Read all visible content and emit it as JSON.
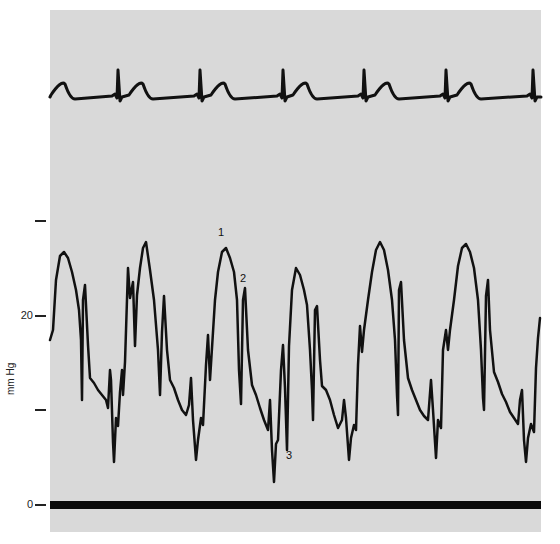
{
  "chart_data": {
    "type": "line",
    "title": "",
    "xlabel": "",
    "ylabel": "mm Hg",
    "ylim": [
      0,
      30
    ],
    "grid": false,
    "legend": null,
    "y_ticks": [
      {
        "value": 0,
        "label": "0",
        "y_px": 505
      },
      {
        "value": 10,
        "label": "",
        "y_px": 410
      },
      {
        "value": 20,
        "label": "20",
        "y_px": 316
      },
      {
        "value": 30,
        "label": "",
        "y_px": 221
      }
    ],
    "annotations": [
      {
        "label": "1",
        "x_px": 218,
        "y_px": 233
      },
      {
        "label": "2",
        "x_px": 240,
        "y_px": 279
      },
      {
        "label": "3",
        "x_px": 286,
        "y_px": 456
      }
    ],
    "series": [
      {
        "name": "ECG",
        "color": "#111111",
        "stroke_width": 3,
        "r_peaks_x": [
          118,
          200,
          283,
          364,
          446,
          533
        ],
        "t_waves_x": [
          65,
          143,
          225,
          307,
          389,
          471
        ],
        "baseline_y": 97,
        "r_peak_y": 70,
        "t_peak_y": 84
      },
      {
        "name": "Pressure",
        "units": "mm Hg",
        "color": "#111111",
        "stroke_width": 2.5,
        "points_px": [
          [
            50,
            340
          ],
          [
            53,
            330
          ],
          [
            56,
            280
          ],
          [
            60,
            256
          ],
          [
            64,
            252
          ],
          [
            68,
            258
          ],
          [
            72,
            272
          ],
          [
            76,
            290
          ],
          [
            79,
            310
          ],
          [
            81,
            340
          ],
          [
            82,
            400
          ],
          [
            83,
            300
          ],
          [
            85,
            285
          ],
          [
            88,
            345
          ],
          [
            90,
            378
          ],
          [
            94,
            383
          ],
          [
            98,
            390
          ],
          [
            102,
            395
          ],
          [
            106,
            400
          ],
          [
            108,
            408
          ],
          [
            110,
            370
          ],
          [
            111,
            380
          ],
          [
            113,
            442
          ],
          [
            114,
            462
          ],
          [
            116,
            418
          ],
          [
            118,
            426
          ],
          [
            120,
            392
          ],
          [
            122,
            370
          ],
          [
            123,
            395
          ],
          [
            125,
            362
          ],
          [
            128,
            268
          ],
          [
            130,
            298
          ],
          [
            133,
            282
          ],
          [
            135,
            346
          ],
          [
            137,
            295
          ],
          [
            140,
            268
          ],
          [
            143,
            248
          ],
          [
            146,
            242
          ],
          [
            150,
            270
          ],
          [
            154,
            300
          ],
          [
            158,
            350
          ],
          [
            160,
            395
          ],
          [
            162,
            332
          ],
          [
            164,
            296
          ],
          [
            167,
            350
          ],
          [
            170,
            380
          ],
          [
            174,
            388
          ],
          [
            178,
            400
          ],
          [
            182,
            410
          ],
          [
            186,
            415
          ],
          [
            189,
            405
          ],
          [
            191,
            378
          ],
          [
            193,
            420
          ],
          [
            196,
            460
          ],
          [
            198,
            440
          ],
          [
            201,
            418
          ],
          [
            203,
            425
          ],
          [
            206,
            365
          ],
          [
            208,
            335
          ],
          [
            210,
            380
          ],
          [
            212,
            348
          ],
          [
            215,
            300
          ],
          [
            218,
            272
          ],
          [
            222,
            252
          ],
          [
            226,
            248
          ],
          [
            230,
            258
          ],
          [
            234,
            272
          ],
          [
            237,
            300
          ],
          [
            239,
            370
          ],
          [
            241,
            404
          ],
          [
            243,
            300
          ],
          [
            245,
            288
          ],
          [
            248,
            350
          ],
          [
            252,
            385
          ],
          [
            256,
            395
          ],
          [
            260,
            408
          ],
          [
            264,
            420
          ],
          [
            268,
            430
          ],
          [
            270,
            400
          ],
          [
            272,
            450
          ],
          [
            274,
            482
          ],
          [
            276,
            444
          ],
          [
            278,
            440
          ],
          [
            281,
            370
          ],
          [
            283,
            345
          ],
          [
            285,
            388
          ],
          [
            287,
            450
          ],
          [
            289,
            346
          ],
          [
            292,
            290
          ],
          [
            296,
            268
          ],
          [
            300,
            275
          ],
          [
            304,
            290
          ],
          [
            307,
            305
          ],
          [
            310,
            350
          ],
          [
            312,
            390
          ],
          [
            313,
            420
          ],
          [
            315,
            310
          ],
          [
            317,
            306
          ],
          [
            320,
            360
          ],
          [
            322,
            386
          ],
          [
            326,
            390
          ],
          [
            330,
            400
          ],
          [
            334,
            415
          ],
          [
            338,
            428
          ],
          [
            342,
            420
          ],
          [
            344,
            400
          ],
          [
            346,
            418
          ],
          [
            349,
            460
          ],
          [
            351,
            438
          ],
          [
            354,
            425
          ],
          [
            356,
            430
          ],
          [
            358,
            365
          ],
          [
            360,
            326
          ],
          [
            362,
            352
          ],
          [
            364,
            330
          ],
          [
            368,
            300
          ],
          [
            372,
            272
          ],
          [
            376,
            250
          ],
          [
            380,
            242
          ],
          [
            384,
            250
          ],
          [
            388,
            270
          ],
          [
            392,
            300
          ],
          [
            395,
            340
          ],
          [
            397,
            395
          ],
          [
            398,
            415
          ],
          [
            399,
            290
          ],
          [
            401,
            282
          ],
          [
            404,
            340
          ],
          [
            408,
            378
          ],
          [
            412,
            390
          ],
          [
            416,
            400
          ],
          [
            420,
            410
          ],
          [
            424,
            416
          ],
          [
            428,
            420
          ],
          [
            431,
            380
          ],
          [
            433,
            410
          ],
          [
            436,
            458
          ],
          [
            438,
            420
          ],
          [
            441,
            428
          ],
          [
            443,
            350
          ],
          [
            446,
            330
          ],
          [
            448,
            350
          ],
          [
            450,
            330
          ],
          [
            454,
            300
          ],
          [
            458,
            266
          ],
          [
            462,
            248
          ],
          [
            466,
            244
          ],
          [
            470,
            252
          ],
          [
            474,
            268
          ],
          [
            478,
            300
          ],
          [
            481,
            350
          ],
          [
            483,
            398
          ],
          [
            484,
            410
          ],
          [
            486,
            296
          ],
          [
            488,
            280
          ],
          [
            490,
            330
          ],
          [
            494,
            372
          ],
          [
            498,
            382
          ],
          [
            502,
            394
          ],
          [
            506,
            402
          ],
          [
            510,
            412
          ],
          [
            514,
            418
          ],
          [
            518,
            424
          ],
          [
            520,
            400
          ],
          [
            522,
            390
          ],
          [
            524,
            440
          ],
          [
            526,
            462
          ],
          [
            528,
            438
          ],
          [
            531,
            424
          ],
          [
            534,
            432
          ],
          [
            536,
            368
          ],
          [
            538,
            338
          ],
          [
            540,
            318
          ]
        ]
      },
      {
        "name": "Zero baseline",
        "color": "#0a0a0a",
        "y_px": 505,
        "stroke_width": 8
      }
    ]
  }
}
